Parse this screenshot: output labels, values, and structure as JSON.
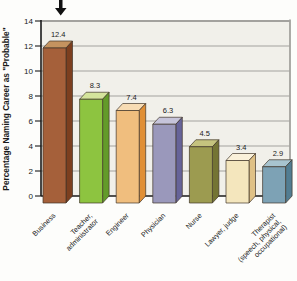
{
  "chart_data": {
    "type": "bar",
    "style": "3d-column",
    "title": "",
    "ylabel": "Percentage Naming Career as \"Probable\"",
    "xlabel": "",
    "ylim": [
      0,
      14
    ],
    "yticks": [
      0,
      2,
      4,
      6,
      8,
      10,
      12,
      14
    ],
    "grid": true,
    "legend": "none",
    "annotation": {
      "shape": "down-arrow",
      "target": "Business"
    },
    "categories": [
      "Business",
      "Teacher, administrator",
      "Engineer",
      "Physician",
      "Nurse",
      "Lawyer, judge",
      "Therapist (speech, physical, occupational)"
    ],
    "category_label_lines": [
      [
        "Business"
      ],
      [
        "Teacher,",
        "administrator"
      ],
      [
        "Engineer"
      ],
      [
        "Physician"
      ],
      [
        "Nurse"
      ],
      [
        "Lawyer, judge"
      ],
      [
        "Therapist",
        "(speech, physical,",
        "occupational)"
      ]
    ],
    "values": [
      12.4,
      8.3,
      7.4,
      6.3,
      4.5,
      3.4,
      2.9
    ],
    "data_labels": [
      "12.4",
      "8.3",
      "7.4",
      "6.3",
      "4.5",
      "3.4",
      "2.9"
    ],
    "colors": {
      "bars": [
        {
          "name": "brown",
          "front": "#a5603a",
          "side": "#7c3f1f",
          "top": "#c4935f"
        },
        {
          "name": "yellow-green",
          "front": "#8dc440",
          "side": "#639b2a",
          "top": "#d4e49c"
        },
        {
          "name": "light-orange",
          "front": "#f0be7e",
          "side": "#e08f35",
          "top": "#f7dcb4"
        },
        {
          "name": "lavender",
          "front": "#9a98bb",
          "side": "#666399",
          "top": "#c6c4da"
        },
        {
          "name": "olive",
          "front": "#9c9b50",
          "side": "#747434",
          "top": "#c5c37e"
        },
        {
          "name": "cream",
          "front": "#f4e6bd",
          "side": "#dfc186",
          "top": "#faf1da"
        },
        {
          "name": "steel-blue",
          "front": "#7da2b5",
          "side": "#527d92",
          "top": "#a8c4cf"
        }
      ],
      "grid": "#a3a29e",
      "axis": "#1a1a1a",
      "outline": "#41352a",
      "plot_bg": "#f1f0ea",
      "arrow": "#111111",
      "text": "#1a1a1a"
    }
  }
}
